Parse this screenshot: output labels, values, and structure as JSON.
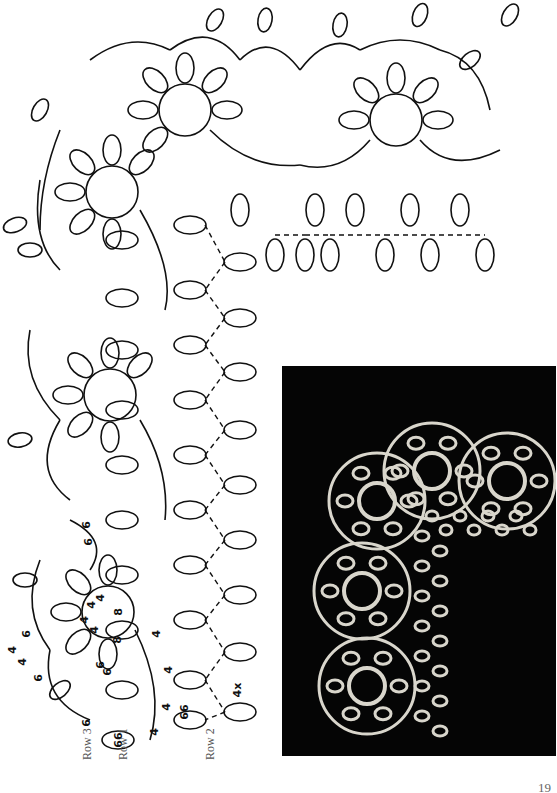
{
  "page": {
    "page_number": "19"
  },
  "diagram": {
    "title_hidden": "Tatting edging and corner pattern",
    "row_labels": [
      "Row 3",
      "Row 1",
      "Row 2"
    ],
    "ring_counts": {
      "center_ring": [
        "4",
        "4",
        "4",
        "4",
        "8",
        "8"
      ],
      "small_ring": [
        "6",
        "6"
      ],
      "row1_ring": "66",
      "row2_ring_a": "66",
      "row2_ring_b": "4x",
      "chain_counts": [
        "4",
        "4",
        "4",
        "4"
      ],
      "outer_counts": [
        "6",
        "4",
        "4",
        "6",
        "6",
        "6",
        "6"
      ]
    }
  },
  "photo": {
    "alt": "Photograph of finished tatted lace corner on black background"
  }
}
